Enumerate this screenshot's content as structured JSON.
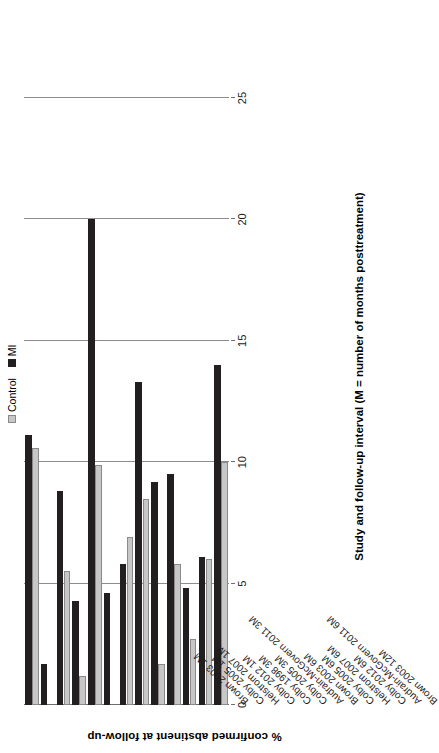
{
  "chart_data": {
    "type": "bar",
    "title": "",
    "subtitle": "",
    "orientation": "vertical-grouped",
    "xlabel": "Study and follow-up interval (M = number of months posttreatment)",
    "ylabel": "% confirmed abstinent at follow-up",
    "ylim": [
      0,
      25
    ],
    "yticks": [
      0,
      5,
      10,
      15,
      20,
      25
    ],
    "ytick_labels": [
      "0",
      "5",
      "10",
      "15",
      "20",
      "25"
    ],
    "grid": true,
    "legend_position": "top-right",
    "categories": [
      "Brown 2003 1M",
      "Colby 2005 1M",
      "Helstrom 2007 1M",
      "Colby 2012 1M",
      "Colby 1998 3M",
      "Colby 2005 3M",
      "Audrain-McGovern 2011 3M",
      "Brown 2003 6M",
      "Colby 2005 6M",
      "Helstrom 2007 6M",
      "Colby 2012 6M",
      "Audrain-McGovern 2011 6M",
      "Brown 2003 12M"
    ],
    "series": [
      {
        "name": "Control",
        "color": "#c7c7c7",
        "values": [
          10.6,
          0,
          5.5,
          1.2,
          9.9,
          0,
          6.9,
          8.5,
          1.7,
          5.8,
          2.7,
          6.0,
          10.0
        ]
      },
      {
        "name": "MI",
        "color": "#231f20",
        "values": [
          11.1,
          1.7,
          8.8,
          4.3,
          20.0,
          4.6,
          5.8,
          13.3,
          9.2,
          9.5,
          4.8,
          6.1,
          14.0
        ]
      }
    ]
  },
  "legend": {
    "items": [
      {
        "label": "Control",
        "swatch": "control-swatch"
      },
      {
        "label": "MI",
        "swatch": "mi-swatch"
      }
    ]
  },
  "axes": {
    "x_title": "Study and follow-up interval (M = number of months posttreatment)",
    "y_title": "% confirmed abstinent at follow-up"
  }
}
